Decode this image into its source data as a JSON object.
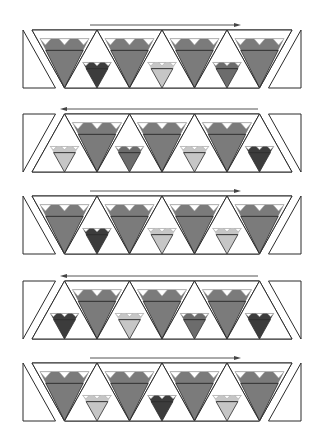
{
  "diagram": {
    "colors": {
      "big_heart": "#7b7b7b",
      "dark": "#3c3c3c",
      "medium": "#6c6c6c",
      "light": "#c6c6c6",
      "outline": "#2b2b2b",
      "guide": "#a8a8a8",
      "background": "#ffffff"
    },
    "geometry": {
      "band_left": 32,
      "tri_width": 65,
      "band_height": 58,
      "side_piece_left": 23,
      "side_piece_right": 301
    },
    "strips": [
      {
        "label": "strip-1",
        "top": 30,
        "arrow": {
          "direction": "right",
          "x1": 90,
          "x2": 237
        },
        "orientation": "inverted-first",
        "small_hearts": [
          "dark",
          "light",
          "medium"
        ]
      },
      {
        "label": "strip-2",
        "top": 114,
        "arrow": {
          "direction": "left",
          "x1": 64,
          "x2": 258
        },
        "orientation": "upright-first",
        "small_hearts": [
          "light",
          "medium",
          "light",
          "dark"
        ]
      },
      {
        "label": "strip-3",
        "top": 196,
        "arrow": {
          "direction": "right",
          "x1": 90,
          "x2": 237
        },
        "orientation": "inverted-first",
        "small_hearts": [
          "dark",
          "light",
          "light"
        ]
      },
      {
        "label": "strip-4",
        "top": 281,
        "arrow": {
          "direction": "left",
          "x1": 64,
          "x2": 258
        },
        "orientation": "upright-first",
        "small_hearts": [
          "dark",
          "light",
          "medium",
          "dark"
        ]
      },
      {
        "label": "strip-5",
        "top": 363,
        "arrow": {
          "direction": "right",
          "x1": 90,
          "x2": 237
        },
        "orientation": "inverted-first",
        "small_hearts": [
          "light",
          "dark",
          "light"
        ]
      }
    ]
  }
}
